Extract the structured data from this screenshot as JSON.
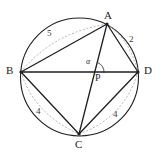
{
  "figure": {
    "type": "geometry-diagram",
    "stroke_color": "#1f1f1f",
    "dashed_color": "#9a9a9a",
    "background": "#ffffff"
  },
  "circle": {
    "cx": 79.5,
    "cy": 77,
    "r": 59
  },
  "vertices": [
    {
      "name": "A",
      "label": "A",
      "x": 107,
      "y": 24,
      "label_x": 104,
      "label_y": 10
    },
    {
      "name": "B",
      "label": "B",
      "x": 21,
      "y": 72,
      "label_x": 6,
      "label_y": 65
    },
    {
      "name": "C",
      "label": "C",
      "x": 79,
      "y": 134,
      "label_x": 75,
      "label_y": 139
    },
    {
      "name": "D",
      "label": "D",
      "x": 138,
      "y": 72,
      "label_x": 144,
      "label_y": 65
    }
  ],
  "intersection": {
    "name": "P",
    "label": "P",
    "x": 93,
    "y": 73,
    "label_x": 95,
    "label_y": 73
  },
  "angle": {
    "label": "α",
    "label_x": 86,
    "label_y": 58,
    "arc_cx": 93,
    "arc_cy": 73
  },
  "chords": [
    {
      "name": "side-AB",
      "from": "B",
      "to": "A",
      "length_label": "5",
      "label_x": 47,
      "label_y": 29
    },
    {
      "name": "side-AD",
      "from": "A",
      "to": "D",
      "length_label": "2",
      "label_x": 129,
      "label_y": 35
    },
    {
      "name": "side-BC",
      "from": "B",
      "to": "C",
      "length_label": "4",
      "label_x": 36,
      "label_y": 107
    },
    {
      "name": "side-CD",
      "from": "C",
      "to": "D",
      "length_label": "4",
      "label_x": 113,
      "label_y": 110
    }
  ],
  "diagonals": [
    {
      "name": "diagonal-BD",
      "from": "B",
      "to": "D"
    },
    {
      "name": "diagonal-AC",
      "from": "A",
      "to": "C"
    }
  ]
}
